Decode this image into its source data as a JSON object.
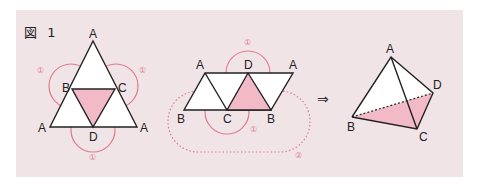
{
  "figure": {
    "title": "図 1",
    "colors": {
      "panel_background": "#f1e4e6",
      "face_fill": "#ffffff",
      "highlight_fill": "#f2b9c6",
      "edge": "#222222",
      "annotation": "#e07b8e"
    },
    "net_triangle": {
      "vertex_labels": {
        "top": "A",
        "left_mid": "B",
        "right_mid": "C",
        "bottom_left": "A",
        "bottom_mid": "D",
        "bottom_right": "A"
      },
      "fold_marks": [
        "①",
        "①",
        "①"
      ]
    },
    "net_strip": {
      "top_labels": [
        "A",
        "D",
        "A"
      ],
      "bottom_labels": [
        "B",
        "C",
        "B"
      ],
      "fold_marks": [
        "①",
        "①"
      ],
      "join_mark": "②"
    },
    "arrow": "⇒",
    "tetrahedron": {
      "vertex_labels": {
        "top": "A",
        "left": "B",
        "right": "D",
        "bottom": "C"
      }
    }
  }
}
